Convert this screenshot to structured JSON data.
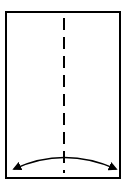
{
  "diagram": {
    "type": "origami-fold-step",
    "paper": {
      "shape": "rectangle",
      "x": 6,
      "y": 12,
      "width": 114,
      "height": 166,
      "stroke": "#000000",
      "fill": "#ffffff"
    },
    "fold_line": {
      "kind": "valley-fold",
      "style": "dashed",
      "x": 64,
      "y1": 18,
      "y2": 173
    },
    "arrow": {
      "kind": "double-headed-curved",
      "from_x": 13,
      "to_x": 117,
      "y_ends": 170,
      "y_peak": 158
    },
    "colors": {
      "line": "#000000",
      "background": "#ffffff"
    }
  }
}
